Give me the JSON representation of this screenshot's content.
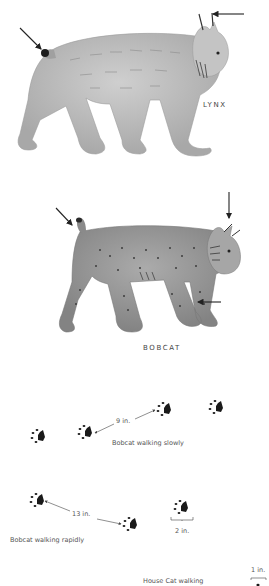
{
  "figures": [
    {
      "name": "lynx",
      "label": "LYNX",
      "colors": {
        "fur": "#b9b9b9",
        "shade": "#8f8f8f",
        "tail_tip": "#1e1e1e"
      },
      "arrows": [
        "tail-tip",
        "ear-tuft"
      ]
    },
    {
      "name": "bobcat",
      "label": "BOBCAT",
      "colors": {
        "fur": "#9a9a9a",
        "shade": "#6e6e6e",
        "spots": "#3a3a3a"
      },
      "arrows": [
        "tail",
        "ear-tuft",
        "foreleg"
      ]
    }
  ],
  "tracks": {
    "slow": {
      "caption": "Bobcat walking slowly",
      "distance": "9 in."
    },
    "rapid": {
      "caption": "Bobcat walking rapidly",
      "distance": "13 in.",
      "print_width": "2 in."
    },
    "housecat": {
      "caption": "House Cat walking",
      "print_width": "1 in."
    }
  },
  "colors": {
    "ink": "#1a1a1a",
    "background": "#ffffff",
    "arrow": "#222222"
  }
}
